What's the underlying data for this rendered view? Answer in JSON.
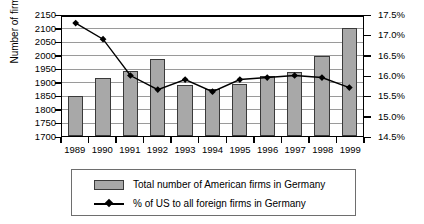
{
  "chart_data": {
    "type": "bar",
    "title": "",
    "categories": [
      "1989",
      "1990",
      "1991",
      "1992",
      "1993",
      "1994",
      "1995",
      "1996",
      "1997",
      "1998",
      "1999"
    ],
    "xlabel": "",
    "ylabel": "Number of firms",
    "ylabel_right": "",
    "ylim": [
      1700,
      2150
    ],
    "ylim_right": [
      14.5,
      17.5
    ],
    "yticks": [
      "2150",
      "2100",
      "2050",
      "2000",
      "1950",
      "1900",
      "1850",
      "1800",
      "1750",
      "1700"
    ],
    "yticks_right": [
      "17.5%",
      "17.0%",
      "16.5%",
      "16.0%",
      "15.5%",
      "15.0%",
      "14.5%"
    ],
    "grid": true,
    "legend_position": "bottom",
    "series": [
      {
        "name": "Total number of American firms in Germany",
        "type": "bar",
        "axis": "left",
        "color": "#a8a8a8",
        "values": [
          1848,
          1913,
          1940,
          1985,
          1888,
          1875,
          1893,
          1922,
          1937,
          1995,
          2098
        ]
      },
      {
        "name": "% of US to all foreign firms in Germany",
        "type": "line",
        "axis": "right",
        "color": "#000000",
        "marker": "diamond",
        "values": [
          17.3,
          16.9,
          16.0,
          15.65,
          15.9,
          15.6,
          15.9,
          15.95,
          16.0,
          15.95,
          15.7
        ]
      }
    ]
  },
  "legend": {
    "items": [
      {
        "label": "Total number of American firms in Germany",
        "marker": "bar-swatch"
      },
      {
        "label": "% of US to all foreign firms in Germany",
        "marker": "line-diamond-swatch"
      }
    ]
  }
}
